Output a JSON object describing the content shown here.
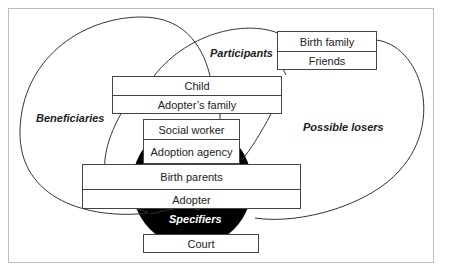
{
  "diagram": {
    "groups": {
      "beneficiaries": "Beneficiaries",
      "participants": "Participants",
      "possible_losers": "Possible losers",
      "specifiers": "Specifiers"
    },
    "boxes": {
      "birth_family_friends": [
        "Birth family",
        "Friends"
      ],
      "child_family": [
        "Child",
        "Adopter’s family"
      ],
      "social_agency": [
        "Social worker",
        "Adoption agency"
      ],
      "parents_adopter": [
        "Birth parents",
        "Adopter"
      ],
      "court": [
        "Court"
      ]
    },
    "colors": {
      "line": "#444444",
      "fill_specifiers": "#000000",
      "frame": "#bdbdbd"
    }
  }
}
